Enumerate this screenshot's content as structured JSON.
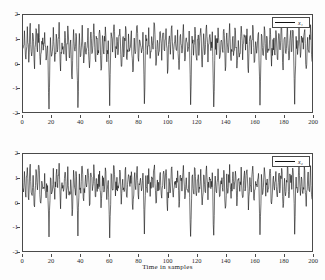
{
  "figure": {
    "background_color": "#fdfdfd",
    "axis_color": "#4a4a4a",
    "line_color": "#111111"
  },
  "chart_data": [
    {
      "type": "line",
      "panel": "top",
      "title": "",
      "xlabel": "",
      "ylabel": "",
      "xlim": [
        0,
        200
      ],
      "ylim": [
        -2,
        2
      ],
      "xticks": [
        0,
        20,
        40,
        60,
        80,
        100,
        120,
        140,
        160,
        180,
        200
      ],
      "xticklabels": [
        "0",
        "20",
        "40",
        "60",
        "80",
        "100",
        "120",
        "140",
        "160",
        "180",
        "200"
      ],
      "yticks": [
        -2,
        -1,
        0,
        1,
        2
      ],
      "yticklabels": [
        "-2",
        "-1",
        "0",
        "1",
        "2"
      ],
      "grid": false,
      "legend": {
        "position": "upper-right",
        "entries": [
          "x₁"
        ]
      },
      "series": [
        {
          "name": "x₁",
          "color": "#111111",
          "mean": 0.5,
          "description": "dense noisy oscillating time series, 200 samples, amplitude range approximately -2 to 2 with occasional deep negative excursions to -1.9",
          "x": [
            0,
            1,
            2,
            3,
            4,
            5,
            6,
            7,
            8,
            9,
            10,
            11,
            12,
            13,
            14,
            15,
            16,
            17,
            18,
            19,
            20,
            21,
            22,
            23,
            24,
            25,
            26,
            27,
            28,
            29,
            30,
            31,
            32,
            33,
            34,
            35,
            36,
            37,
            38,
            39,
            40,
            41,
            42,
            43,
            44,
            45,
            46,
            47,
            48,
            49,
            50,
            51,
            52,
            53,
            54,
            55,
            56,
            57,
            58,
            59,
            60,
            61,
            62,
            63,
            64,
            65,
            66,
            67,
            68,
            69,
            70,
            71,
            72,
            73,
            74,
            75,
            76,
            77,
            78,
            79,
            80,
            81,
            82,
            83,
            84,
            85,
            86,
            87,
            88,
            89,
            90,
            91,
            92,
            93,
            94,
            95,
            96,
            97,
            98,
            99,
            100,
            101,
            102,
            103,
            104,
            105,
            106,
            107,
            108,
            109,
            110,
            111,
            112,
            113,
            114,
            115,
            116,
            117,
            118,
            119,
            120,
            121,
            122,
            123,
            124,
            125,
            126,
            127,
            128,
            129,
            130,
            131,
            132,
            133,
            134,
            135,
            136,
            137,
            138,
            139,
            140,
            141,
            142,
            143,
            144,
            145,
            146,
            147,
            148,
            149,
            150,
            151,
            152,
            153,
            154,
            155,
            156,
            157,
            158,
            159,
            160,
            161,
            162,
            163,
            164,
            165,
            166,
            167,
            168,
            169,
            170,
            171,
            172,
            173,
            174,
            175,
            176,
            177,
            178,
            179,
            180,
            181,
            182,
            183,
            184,
            185,
            186,
            187,
            188,
            189,
            190,
            191,
            192,
            193,
            194,
            195,
            196,
            197,
            198,
            199,
            200
          ],
          "values": [
            0.62,
            1.35,
            0.18,
            1.52,
            0.05,
            1.66,
            0.31,
            1.18,
            -0.22,
            1.44,
            0.48,
            1.62,
            -0.05,
            0.92,
            0.55,
            1.28,
            0.14,
            0.73,
            -1.88,
            1.07,
            0.36,
            1.49,
            0.08,
            1.21,
            0.58,
            1.7,
            -0.31,
            0.85,
            0.42,
            1.33,
            0.11,
            1.55,
            0.26,
            0.97,
            -0.64,
            1.4,
            0.51,
            1.12,
            -1.82,
            1.24,
            0.33,
            1.58,
            0.02,
            0.88,
            0.61,
            1.46,
            -0.18,
            1.3,
            0.45,
            1.64,
            0.19,
            1.02,
            0.54,
            1.38,
            -0.28,
            1.15,
            0.39,
            1.51,
            0.07,
            0.94,
            -1.74,
            1.27,
            0.47,
            1.6,
            0.23,
            1.08,
            0.56,
            1.42,
            -0.12,
            0.99,
            0.41,
            1.53,
            0.16,
            1.22,
            0.63,
            1.35,
            -0.35,
            1.05,
            0.5,
            1.57,
            0.09,
            0.91,
            0.44,
            1.29,
            -1.66,
            1.18,
            0.37,
            1.48,
            0.21,
            1.11,
            0.59,
            1.63,
            -0.08,
            0.96,
            0.46,
            1.32,
            0.13,
            1.25,
            0.52,
            1.44,
            -0.41,
            1.01,
            0.38,
            1.56,
            0.17,
            0.89,
            0.57,
            1.39,
            -0.25,
            1.2,
            0.43,
            1.61,
            0.1,
            1.06,
            0.49,
            1.34,
            -1.7,
            1.13,
            0.34,
            1.5,
            0.24,
            0.98,
            0.6,
            1.45,
            -0.15,
            1.23,
            0.4,
            1.59,
            0.06,
            1.09,
            0.53,
            1.31,
            -1.79,
            1.16,
            0.36,
            1.47,
            0.2,
            0.93,
            0.58,
            1.41,
            -0.3,
            1.26,
            0.44,
            1.65,
            0.12,
            1.04,
            0.51,
            1.37,
            -0.19,
            0.95,
            0.42,
            1.54,
            0.15,
            1.19,
            0.55,
            1.43,
            -0.38,
            1.1,
            0.39,
            1.58,
            0.04,
            0.9,
            0.61,
            1.28,
            -1.72,
            1.21,
            0.35,
            1.52,
            0.22,
            1.03,
            0.54,
            1.46,
            -0.11,
            0.99,
            0.47,
            1.36,
            0.18,
            1.24,
            0.56,
            1.49,
            -0.27,
            1.07,
            0.41,
            1.62,
            0.14,
            1.17,
            0.5,
            1.33,
            -1.68,
            1.12,
            0.37,
            1.55,
            0.25,
            0.97,
            0.59,
            1.4,
            -0.21,
            1.08,
            0.45,
            1.6,
            0.08,
            1.14,
            0.52,
            1.38,
            -0.33,
            1.02,
            0.48,
            1.51,
            0.16,
            1.3,
            0.6
          ]
        }
      ]
    },
    {
      "type": "line",
      "panel": "bottom",
      "title": "",
      "xlabel": "Time in samples",
      "ylabel": "",
      "xlim": [
        0,
        200
      ],
      "ylim": [
        -2,
        2
      ],
      "xticks": [
        0,
        20,
        40,
        60,
        80,
        100,
        120,
        140,
        160,
        180,
        200
      ],
      "xticklabels": [
        "0",
        "20",
        "40",
        "60",
        "80",
        "100",
        "120",
        "140",
        "160",
        "180",
        "200"
      ],
      "yticks": [
        -2,
        -1,
        0,
        1,
        2
      ],
      "yticklabels": [
        "-2",
        "-1",
        "0",
        "1",
        "2"
      ],
      "grid": false,
      "legend": {
        "position": "upper-right",
        "entries": [
          "x₂"
        ]
      },
      "series": [
        {
          "name": "x₂",
          "color": "#111111",
          "mean": 0.5,
          "description": "dense noisy oscillating time series, 200 samples, amplitude range approximately -1.6 to 1.9, similar statistics to upper panel",
          "x": [
            0,
            1,
            2,
            3,
            4,
            5,
            6,
            7,
            8,
            9,
            10,
            11,
            12,
            13,
            14,
            15,
            16,
            17,
            18,
            19,
            20,
            21,
            22,
            23,
            24,
            25,
            26,
            27,
            28,
            29,
            30,
            31,
            32,
            33,
            34,
            35,
            36,
            37,
            38,
            39,
            40,
            41,
            42,
            43,
            44,
            45,
            46,
            47,
            48,
            49,
            50,
            51,
            52,
            53,
            54,
            55,
            56,
            57,
            58,
            59,
            60,
            61,
            62,
            63,
            64,
            65,
            66,
            67,
            68,
            69,
            70,
            71,
            72,
            73,
            74,
            75,
            76,
            77,
            78,
            79,
            80,
            81,
            82,
            83,
            84,
            85,
            86,
            87,
            88,
            89,
            90,
            91,
            92,
            93,
            94,
            95,
            96,
            97,
            98,
            99,
            100,
            101,
            102,
            103,
            104,
            105,
            106,
            107,
            108,
            109,
            110,
            111,
            112,
            113,
            114,
            115,
            116,
            117,
            118,
            119,
            120,
            121,
            122,
            123,
            124,
            125,
            126,
            127,
            128,
            129,
            130,
            131,
            132,
            133,
            134,
            135,
            136,
            137,
            138,
            139,
            140,
            141,
            142,
            143,
            144,
            145,
            146,
            147,
            148,
            149,
            150,
            151,
            152,
            153,
            154,
            155,
            156,
            157,
            158,
            159,
            160,
            161,
            162,
            163,
            164,
            165,
            166,
            167,
            168,
            169,
            170,
            171,
            172,
            173,
            174,
            175,
            176,
            177,
            178,
            179,
            180,
            181,
            182,
            183,
            184,
            185,
            186,
            187,
            188,
            189,
            190,
            191,
            192,
            193,
            194,
            195,
            196,
            197,
            198,
            199,
            200
          ],
          "values": [
            0.58,
            1.28,
            0.22,
            1.44,
            0.11,
            1.58,
            0.34,
            1.12,
            -0.18,
            1.36,
            0.52,
            1.54,
            0.02,
            0.88,
            0.57,
            1.2,
            0.19,
            0.7,
            -1.42,
            1.02,
            0.4,
            1.41,
            0.13,
            1.16,
            0.61,
            1.62,
            -0.26,
            0.82,
            0.46,
            1.25,
            0.16,
            1.48,
            0.3,
            0.94,
            -0.55,
            1.33,
            0.54,
            1.08,
            -1.38,
            1.18,
            0.38,
            1.5,
            0.07,
            0.85,
            0.64,
            1.39,
            -0.13,
            1.22,
            0.49,
            1.56,
            0.24,
            0.98,
            0.57,
            1.3,
            -0.22,
            1.1,
            0.43,
            1.43,
            0.12,
            0.91,
            -1.46,
            1.19,
            0.51,
            1.52,
            0.27,
            1.04,
            0.59,
            1.34,
            -0.07,
            0.96,
            0.45,
            1.45,
            0.21,
            1.15,
            0.66,
            1.27,
            -0.29,
            1.01,
            0.53,
            1.49,
            0.14,
            0.88,
            0.48,
            1.21,
            -1.3,
            1.11,
            0.41,
            1.4,
            0.25,
            1.06,
            0.62,
            1.55,
            -0.03,
            0.93,
            0.5,
            1.24,
            0.18,
            1.17,
            0.56,
            1.36,
            -0.34,
            0.99,
            0.42,
            1.47,
            0.22,
            0.86,
            0.6,
            1.31,
            -0.2,
            1.13,
            0.47,
            1.53,
            0.15,
            1.02,
            0.52,
            1.26,
            -1.4,
            1.07,
            0.39,
            1.42,
            0.28,
            0.95,
            0.63,
            1.37,
            -0.1,
            1.14,
            0.44,
            1.51,
            0.11,
            1.05,
            0.57,
            1.23,
            -1.35,
            1.09,
            0.4,
            1.39,
            0.24,
            0.9,
            0.61,
            1.33,
            -0.24,
            1.18,
            0.48,
            1.57,
            0.17,
            1.0,
            0.55,
            1.29,
            -0.14,
            0.92,
            0.46,
            1.46,
            0.2,
            1.12,
            0.58,
            1.35,
            -0.31,
            1.03,
            0.43,
            1.5,
            0.09,
            0.87,
            0.64,
            1.2,
            -1.33,
            1.16,
            0.38,
            1.44,
            0.26,
            0.97,
            0.58,
            1.38,
            -0.06,
            0.96,
            0.51,
            1.28,
            0.23,
            1.17,
            0.59,
            1.41,
            -0.21,
            1.0,
            0.45,
            1.54,
            0.19,
            1.1,
            0.54,
            1.25,
            -1.31,
            1.05,
            0.4,
            1.47,
            0.29,
            0.94,
            0.62,
            1.32,
            -0.16,
            1.01,
            0.49,
            1.52,
            0.13,
            1.07,
            0.56,
            1.3,
            -0.27,
            0.98,
            0.52,
            1.43,
            0.21,
            1.22,
            0.63
          ]
        }
      ]
    }
  ]
}
